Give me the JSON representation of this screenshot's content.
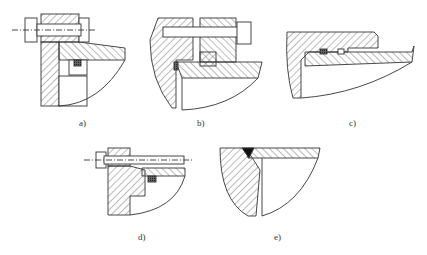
{
  "figure": {
    "panels": [
      {
        "id": "a",
        "label": "a)"
      },
      {
        "id": "b",
        "label": "b)"
      },
      {
        "id": "c",
        "label": "c)"
      },
      {
        "id": "d",
        "label": "d)"
      },
      {
        "id": "e",
        "label": "e)"
      }
    ],
    "colors": {
      "line": "#333333",
      "hatch": "#555555",
      "seal": "#444444",
      "background": "#ffffff"
    }
  }
}
